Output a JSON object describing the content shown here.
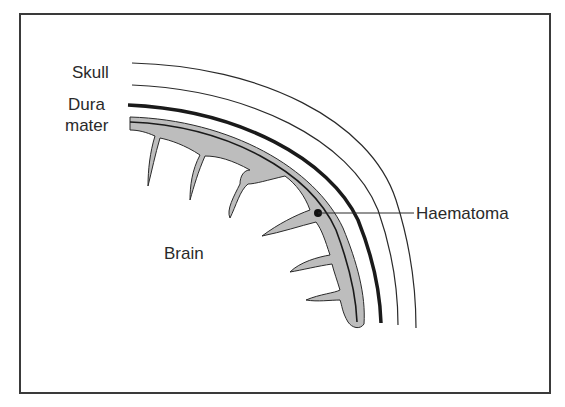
{
  "diagram": {
    "labels": {
      "skull": "Skull",
      "dura_line1": "Dura",
      "dura_line2": "mater",
      "haematoma": "Haematoma",
      "brain": "Brain"
    },
    "colors": {
      "frame": "#3a3a3a",
      "line": "#2a2a2a",
      "haematoma_fill": "#bdbdbd",
      "background": "#ffffff",
      "text": "#2a2a2a"
    }
  }
}
